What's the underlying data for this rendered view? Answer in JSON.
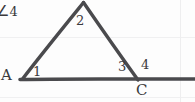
{
  "diagram": {
    "background_color": "#fdfdfd",
    "stroke_color": "#4a4a4d",
    "grid": {
      "visible": true,
      "color": "#f0f0f1",
      "horizontal_y": [
        37,
        97
      ],
      "vertical_x": [
        180
      ]
    },
    "vertices": [
      {
        "name": "A",
        "label": "A",
        "x": 22,
        "y": 79,
        "label_x": 1,
        "label_y": 68
      },
      {
        "name": "B",
        "label": "",
        "x": 83,
        "y": 2,
        "label_x": 78,
        "label_y": -14
      },
      {
        "name": "C",
        "label": "C",
        "x": 137,
        "y": 79,
        "label_x": 136,
        "label_y": 83
      }
    ],
    "segments": [
      {
        "name": "side-AB",
        "x1": 22,
        "y1": 79,
        "x2": 83,
        "y2": 2
      },
      {
        "name": "side-BC",
        "x1": 83,
        "y1": 2,
        "x2": 138,
        "y2": 80
      },
      {
        "name": "base-line-through-A-and-C",
        "x1": 20,
        "y1": 79,
        "x2": 195,
        "y2": 79
      }
    ],
    "angle_labels": [
      {
        "name": "angle-1-at-A",
        "text": "1",
        "x": 33,
        "y": 65
      },
      {
        "name": "angle-2-at-B",
        "text": "2",
        "x": 76,
        "y": 14
      },
      {
        "name": "angle-3-at-C-interior",
        "text": "3",
        "x": 118,
        "y": 60
      },
      {
        "name": "angle-4-at-C-exterior",
        "text": "4",
        "x": 141,
        "y": 58
      }
    ],
    "notes": [
      {
        "name": "angle-4-annotation",
        "symbol": "∠",
        "text": "4",
        "x": -3,
        "y": 5
      }
    ]
  }
}
